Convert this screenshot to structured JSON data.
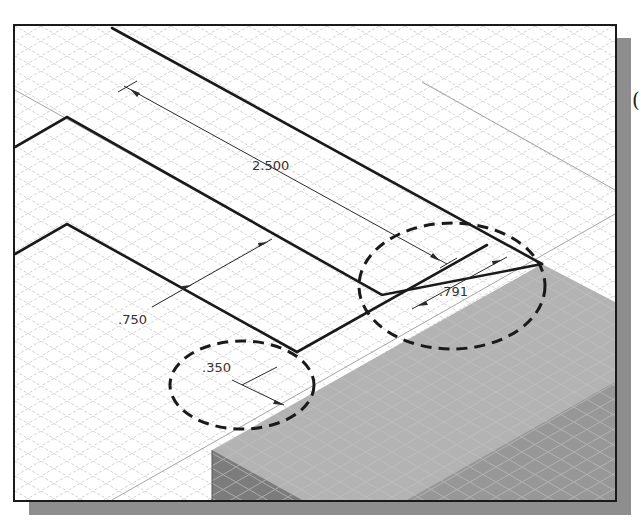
{
  "viewport": {
    "title": "Isometric sketch view with dimensions",
    "background": "#ffffff",
    "grid_color": "#c8c8c8",
    "line_color": "#1a1a1a",
    "solid_top_color": "#b0b0b0",
    "solid_front_color": "#8f8f8f"
  },
  "dimensions": [
    {
      "id": "dim-2500",
      "label": "2.500"
    },
    {
      "id": "dim-750",
      "label": ".750"
    },
    {
      "id": "dim-350",
      "label": ".350"
    },
    {
      "id": "dim-791",
      "label": ".791"
    }
  ],
  "callouts": [
    {
      "id": "callout-350",
      "style": "dashed-ellipse",
      "encircles": ".350"
    },
    {
      "id": "callout-791",
      "style": "dashed-ellipse",
      "encircles": ".791"
    }
  ],
  "edge_text": "("
}
